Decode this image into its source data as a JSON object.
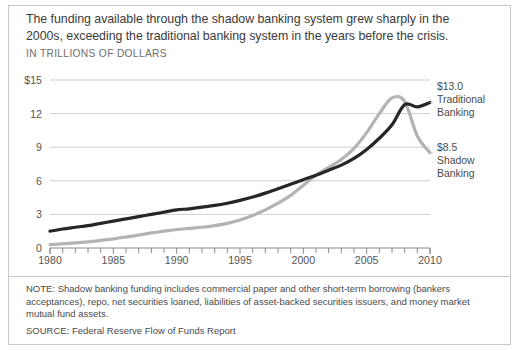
{
  "headline": "The funding available through the shadow banking system grew sharply in the 2000s, exceeding the traditional banking system in the years before the crisis.",
  "subhead": "IN TRILLIONS OF DOLLARS",
  "annotations": {
    "traditional": {
      "value": "$13.0",
      "label_line1": "Traditional",
      "label_line2": "Banking"
    },
    "shadow": {
      "value": "$8.5",
      "label_line1": "Shadow",
      "label_line2": "Banking"
    }
  },
  "footer": {
    "note": "NOTE: Shadow banking funding includes commercial paper and other short-term borrowing (bankers acceptances), repo, net securities loaned, liabilities of asset-backed securities issuers, and money market mutual fund assets.",
    "source": "SOURCE: Federal Reserve Flow of Funds Report"
  },
  "colors": {
    "traditional_line": "#262626",
    "shadow_line": "#b3b3b3",
    "gridline": "#cfcfcf",
    "axis": "#8a8a8a",
    "frame": "#c9c9c9",
    "text": "#4a4a4a"
  },
  "chart_data": {
    "type": "line",
    "title": "The funding available through the shadow banking system grew sharply in the 2000s, exceeding the traditional banking system in the years before the crisis.",
    "subtitle": "IN TRILLIONS OF DOLLARS",
    "xlabel": "",
    "ylabel": "IN TRILLIONS OF DOLLARS",
    "xlim": [
      1980,
      2010
    ],
    "ylim": [
      0,
      15
    ],
    "xticks": [
      1980,
      1985,
      1990,
      1995,
      2000,
      2005,
      2010
    ],
    "xtick_labels": [
      "1980",
      "1985",
      "1990",
      "1995",
      "2000",
      "2005",
      "2010"
    ],
    "minor_xtick_interval": 1,
    "yticks": [
      0,
      3,
      6,
      9,
      12,
      15
    ],
    "ytick_labels": [
      "0",
      "3",
      "6",
      "9",
      "12",
      "$15"
    ],
    "grid": "horizontal",
    "legend": "right-annotations",
    "x": [
      1980,
      1981,
      1982,
      1983,
      1984,
      1985,
      1986,
      1987,
      1988,
      1989,
      1990,
      1991,
      1992,
      1993,
      1994,
      1995,
      1996,
      1997,
      1998,
      1999,
      2000,
      2001,
      2002,
      2003,
      2004,
      2005,
      2006,
      2007,
      2008,
      2009,
      2010
    ],
    "series": [
      {
        "name": "Traditional Banking",
        "color": "#262626",
        "end_value": 13.0,
        "values": [
          1.5,
          1.7,
          1.85,
          2.0,
          2.2,
          2.4,
          2.6,
          2.8,
          3.0,
          3.2,
          3.4,
          3.5,
          3.65,
          3.8,
          4.0,
          4.25,
          4.55,
          4.9,
          5.3,
          5.7,
          6.1,
          6.5,
          6.95,
          7.4,
          8.0,
          8.8,
          9.8,
          11.0,
          12.8,
          12.6,
          13.0
        ]
      },
      {
        "name": "Shadow Banking",
        "color": "#b3b3b3",
        "end_value": 8.5,
        "values": [
          0.3,
          0.38,
          0.45,
          0.55,
          0.68,
          0.82,
          0.98,
          1.15,
          1.35,
          1.5,
          1.65,
          1.75,
          1.85,
          2.0,
          2.2,
          2.5,
          2.9,
          3.4,
          4.0,
          4.7,
          5.6,
          6.5,
          7.2,
          7.9,
          8.9,
          10.3,
          12.0,
          13.4,
          13.1,
          10.0,
          8.5
        ]
      }
    ],
    "annotations": [
      {
        "text": "$13.0 Traditional Banking",
        "x": 2010,
        "y": 13.0
      },
      {
        "text": "$8.5 Shadow Banking",
        "x": 2010,
        "y": 8.5
      }
    ]
  }
}
